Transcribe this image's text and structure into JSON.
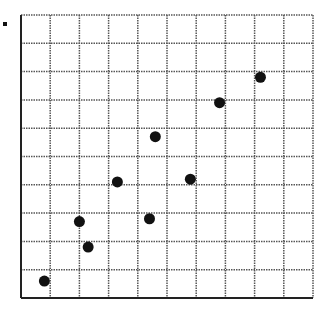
{
  "chart_data": {
    "type": "scatter",
    "title": "",
    "xlabel": "",
    "ylabel": "",
    "xlim": [
      0,
      10
    ],
    "ylim": [
      0,
      10
    ],
    "grid": true,
    "grid_style": "dotted",
    "x_ticks": [
      0,
      1,
      2,
      3,
      4,
      5,
      6,
      7,
      8,
      9,
      10
    ],
    "y_ticks": [
      0,
      1,
      2,
      3,
      4,
      5,
      6,
      7,
      8,
      9,
      10
    ],
    "tick_labels_visible": false,
    "legend": null,
    "series": [
      {
        "name": "points",
        "color": "#111111",
        "x": [
          0.8,
          2.3,
          2.0,
          3.3,
          4.4,
          4.6,
          5.8,
          6.8,
          8.2
        ],
        "y": [
          0.6,
          1.8,
          2.7,
          4.1,
          2.8,
          5.7,
          4.2,
          6.9,
          7.8
        ]
      }
    ]
  },
  "plot": {
    "left": 21,
    "top": 15,
    "right": 313,
    "bottom": 298,
    "point_radius": 5.5,
    "axis_color": "#222222",
    "grid_color": "#555555"
  }
}
